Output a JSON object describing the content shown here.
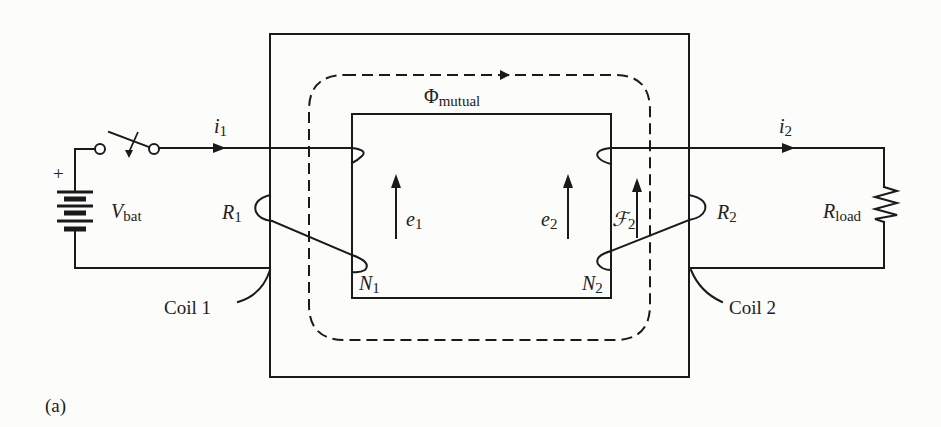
{
  "figure": {
    "panel_label": "(a)"
  },
  "core": {
    "flux_label": "Φ",
    "flux_subscript": "mutual"
  },
  "primary": {
    "battery_label": "V",
    "battery_subscript": "bat",
    "battery_polarity": "+",
    "current_label": "i",
    "current_subscript": "1",
    "resistance_label": "R",
    "resistance_subscript": "1",
    "emf_label": "e",
    "emf_subscript": "1",
    "turns_label": "N",
    "turns_subscript": "1",
    "coil_callout": "Coil 1"
  },
  "secondary": {
    "load_label": "R",
    "load_subscript": "load",
    "current_label": "i",
    "current_subscript": "2",
    "resistance_label": "R",
    "resistance_subscript": "2",
    "emf_label": "e",
    "emf_subscript": "2",
    "mmf_label": "ℱ",
    "mmf_subscript": "2",
    "turns_label": "N",
    "turns_subscript": "2",
    "coil_callout": "Coil 2"
  },
  "colors": {
    "ink": "#1a1a1a",
    "paper": "#fcfcfb"
  }
}
